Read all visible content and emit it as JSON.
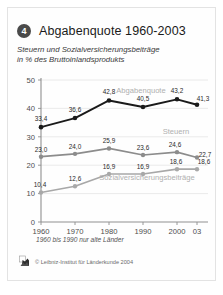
{
  "card": {
    "number_badge": "4",
    "title": "Abgabenquote 1960-2003",
    "subtitle_line1": "Steuern und Sozialversicherungsbeiträge",
    "subtitle_line2": "in % des Bruttoinlandsprodukts",
    "footnote": "1960 bis 1990 nur alte Länder",
    "credit": "© Leibniz-Institut für Länderkunde 2004",
    "logo_icon": "ifl-logo-icon"
  },
  "colors": {
    "abgabenquote": "#1a1a1a",
    "steuern": "#8c8c8c",
    "sozialversicherung": "#a8a8a8",
    "axis": "#8f8f8f",
    "grid": "#e8e8e8",
    "series_label": "#b0b0b0",
    "badge": "#4a4a4a",
    "background": "#ffffff",
    "frame_border": "#e3e3e3"
  },
  "chart_data": {
    "type": "line",
    "title": "Abgabenquote 1960-2003",
    "subtitle": "Steuern und Sozialversicherungsbeiträge in % des Bruttoinlandsprodukts",
    "xlabel": "",
    "ylabel": "",
    "categories": [
      "1960",
      "1970",
      "1980",
      "1990",
      "2000",
      "03"
    ],
    "x_tick_labels": [
      "1960",
      "1970",
      "1980",
      "1990",
      "2000",
      "03"
    ],
    "y_tick_labels": [
      "0",
      "10",
      "20",
      "30",
      "40",
      "50"
    ],
    "y_ticks": [
      0,
      10,
      20,
      30,
      40,
      50
    ],
    "ylim": [
      0,
      50
    ],
    "grid": true,
    "legend_position": "inline-labels",
    "annotation": "1960 bis 1990 nur alte Länder",
    "series": [
      {
        "name": "Abgabenquote",
        "color": "#1a1a1a",
        "values": [
          33.4,
          36.6,
          42.8,
          40.5,
          43.2,
          41.3
        ],
        "value_labels": [
          "33,4",
          "36,6",
          "42,8",
          "40,5",
          "43,2",
          "41,3"
        ]
      },
      {
        "name": "Steuern",
        "color": "#8c8c8c",
        "values": [
          23.0,
          24.0,
          25.9,
          23.6,
          24.6,
          22.7
        ],
        "value_labels": [
          "23,0",
          "24,0",
          "25,9",
          "23,6",
          "24,6",
          "22,7"
        ]
      },
      {
        "name": "Sozialversicherungsbeiträge",
        "color": "#a8a8a8",
        "values": [
          10.4,
          12.6,
          16.9,
          16.9,
          18.6,
          18.6
        ],
        "value_labels": [
          "10,4",
          "12,6",
          "16,9",
          "16,9",
          "18,6",
          "18,6"
        ]
      }
    ]
  }
}
